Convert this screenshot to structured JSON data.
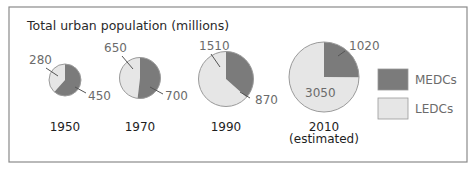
{
  "chart_data": {
    "type": "pie",
    "title": "Total urban population (millions)",
    "unit": "millions",
    "colors": {
      "MEDCs": "#7b7b7b",
      "LEDCs": "#e6e6e6"
    },
    "legend": {
      "placement": "right",
      "entries": [
        {
          "name": "MEDCs",
          "color": "#7b7b7b"
        },
        {
          "name": "LEDCs",
          "color": "#e6e6e6"
        }
      ]
    },
    "charts": [
      {
        "year": "1950",
        "sublabel": "",
        "MEDCs": 450,
        "LEDCs": 280,
        "total": 730
      },
      {
        "year": "1970",
        "sublabel": "",
        "MEDCs": 700,
        "LEDCs": 650,
        "total": 1350
      },
      {
        "year": "1990",
        "sublabel": "",
        "MEDCs": 870,
        "LEDCs": 1510,
        "total": 2380
      },
      {
        "year": "2010",
        "sublabel": "(estimated)",
        "MEDCs": 1020,
        "LEDCs": 3050,
        "total": 4070
      }
    ]
  }
}
